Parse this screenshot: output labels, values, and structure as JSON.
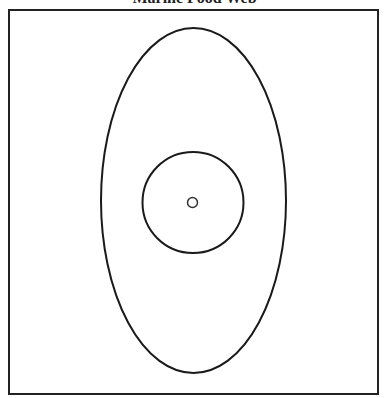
{
  "title": "Marine Food Web",
  "frame": {
    "x": 9,
    "y": 10,
    "width": 369,
    "height": 384,
    "stroke": "#222222"
  },
  "shapes": [
    {
      "name": "outer-ellipse",
      "cx": 193.5,
      "cy": 200.5,
      "rx": 92.5,
      "ry": 172.5,
      "stroke": "#1a1a1a"
    },
    {
      "name": "middle-circle",
      "cx": 193,
      "cy": 202.5,
      "r": 50.5,
      "stroke": "#1a1a1a"
    },
    {
      "name": "inner-circle",
      "cx": 192.5,
      "cy": 202.5,
      "r": 5,
      "stroke": "#333333"
    }
  ]
}
